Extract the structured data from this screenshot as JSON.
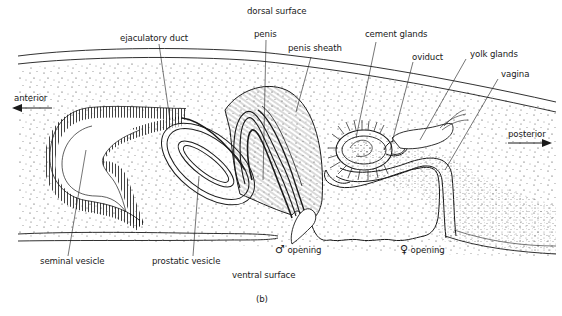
{
  "figure": {
    "caption": "(b)",
    "orientation": {
      "dorsal": "dorsal surface",
      "ventral": "ventral surface",
      "anterior": "anterior",
      "posterior": "posterior"
    },
    "labels": {
      "ejaculatory_duct": "ejaculatory duct",
      "penis": "penis",
      "penis_sheath": "penis sheath",
      "cement_glands": "cement glands",
      "oviduct": "oviduct",
      "yolk_glands": "yolk glands",
      "vagina": "vagina",
      "seminal_vesicle": "seminal vesicle",
      "prostatic_vesicle": "prostatic vesicle",
      "male_opening_symbol": "♂",
      "male_opening": "opening",
      "female_opening_symbol": "♀",
      "female_opening": "opening"
    },
    "colors": {
      "ink": "#1a1a1a",
      "background": "#ffffff"
    }
  }
}
